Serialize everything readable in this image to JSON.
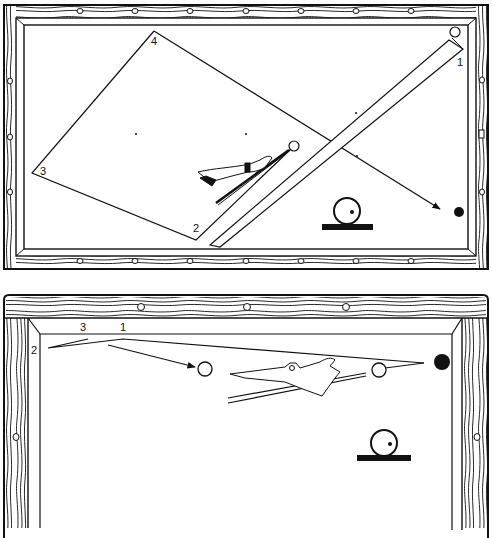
{
  "figure": {
    "colors": {
      "ink": "#111111",
      "paper": "#ffffff"
    }
  },
  "table_top": {
    "corner_labels": [
      {
        "text": "4",
        "x": 151,
        "y": 45
      },
      {
        "text": "1",
        "x": 457,
        "y": 66
      },
      {
        "text": "3",
        "x": 40,
        "y": 175
      },
      {
        "text": "2",
        "x": 193,
        "y": 232
      }
    ],
    "object_ball": "white",
    "target_ball": "black",
    "english_indicator": "cue-ball-with-offset-dot"
  },
  "table_bottom": {
    "rail_labels": [
      {
        "text": "2",
        "x": 31,
        "y": 354
      },
      {
        "text": "3",
        "x": 80,
        "y": 331
      },
      {
        "text": "1",
        "x": 120,
        "y": 331
      }
    ],
    "object_balls": [
      "white",
      "white"
    ],
    "target_ball": "black",
    "english_indicator": "cue-ball-with-offset-dot"
  }
}
